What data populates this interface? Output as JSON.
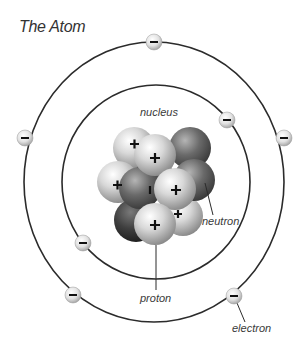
{
  "title": "The Atom",
  "labels": {
    "nucleus": "nucleus",
    "neutron": "neutron",
    "proton": "proton",
    "electron": "electron"
  },
  "symbols": {
    "proton_charge": "+",
    "electron_charge": "−"
  },
  "diagram": {
    "orbits": [
      {
        "name": "inner-orbit",
        "electrons": 2
      },
      {
        "name": "outer-orbit",
        "electrons": 5
      }
    ],
    "nucleus": {
      "particles": [
        "proton",
        "neutron"
      ]
    }
  },
  "colors": {
    "orbit": "#2b2b2b",
    "proton": "#d4d4d4",
    "neutron": "#6e6e6e",
    "electron": "#e0e0e0",
    "text": "#3a3a3a"
  }
}
